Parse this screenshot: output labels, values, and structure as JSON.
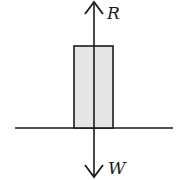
{
  "diagram": {
    "type": "free-body diagram",
    "forces": [
      {
        "label": "R",
        "direction": "up"
      },
      {
        "label": "W",
        "direction": "down"
      }
    ],
    "object": "block resting on surface",
    "colors": {
      "stroke": "#1a1a1a",
      "block_fill": "#e6e6e6",
      "background": "#ffffff"
    }
  }
}
